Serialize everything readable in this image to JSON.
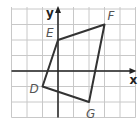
{
  "diagram": {
    "type": "coordinate-plane-quadrilateral",
    "axes": {
      "x_label": "x",
      "y_label": "y"
    },
    "grid": {
      "x_min": -3,
      "x_max": 5,
      "y_min": -3,
      "y_max": 4,
      "spacing_px": 15.5
    },
    "vertices": [
      {
        "label": "D",
        "x": -1,
        "y": -1
      },
      {
        "label": "E",
        "x": 0,
        "y": 2
      },
      {
        "label": "F",
        "x": 3,
        "y": 3
      },
      {
        "label": "G",
        "x": 2,
        "y": -2
      }
    ],
    "colors": {
      "grid": "#c8c8c8",
      "axis": "#222222",
      "shape": "#333333",
      "label": "#555555"
    }
  }
}
